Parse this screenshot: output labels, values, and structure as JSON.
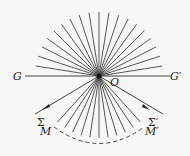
{
  "diagram": {
    "labels": {
      "G": "G",
      "G_prime": "G′",
      "O": "O",
      "Sigma": "Σ",
      "Sigma_prime": "Σ′",
      "M": "M",
      "M_prime": "M′"
    },
    "center": {
      "x": 99,
      "y": 76
    },
    "upper_fan": {
      "ray_count": 19,
      "angle_start_deg": 9,
      "angle_end_deg": 171,
      "length": 64
    },
    "lower_fan": {
      "ray_count": 11,
      "angle_start_deg": 228,
      "angle_end_deg": 312,
      "length": 62
    },
    "colors": {
      "line": "#333333",
      "background": "#f7f7f5"
    }
  }
}
